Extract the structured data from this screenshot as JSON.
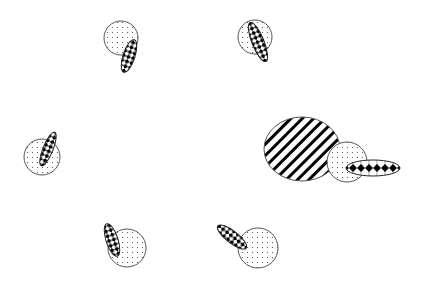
{
  "diagram": {
    "width": 421,
    "height": 294,
    "background": "#ffffff",
    "stroke_color": "#555555",
    "fill_color": "#000000",
    "groups": [
      {
        "name": "top-left-pair",
        "circle": {
          "cx": 121,
          "cy": 38,
          "r": 17,
          "pattern": "dots"
        },
        "ellipse": {
          "cx": 129,
          "cy": 56,
          "rx": 6,
          "ry": 17,
          "rotate": 18,
          "pattern": "checker"
        }
      },
      {
        "name": "top-right-pair",
        "circle": {
          "cx": 255,
          "cy": 37,
          "r": 17,
          "pattern": "dots"
        },
        "ellipse": {
          "cx": 258,
          "cy": 42,
          "rx": 6,
          "ry": 21,
          "rotate": -22,
          "pattern": "checker"
        }
      },
      {
        "name": "left-pair",
        "circle": {
          "cx": 42,
          "cy": 157,
          "r": 18,
          "pattern": "dots"
        },
        "ellipse": {
          "cx": 48,
          "cy": 149,
          "rx": 5,
          "ry": 18,
          "rotate": 22,
          "pattern": "checker"
        }
      },
      {
        "name": "right-cluster",
        "big_ellipse": {
          "cx": 302,
          "cy": 149,
          "rx": 38,
          "ry": 32,
          "pattern": "hatch"
        },
        "circle": {
          "cx": 347,
          "cy": 162,
          "r": 20,
          "pattern": "dots"
        },
        "ellipse": {
          "cx": 373,
          "cy": 168,
          "rx": 27,
          "ry": 8,
          "rotate": 0,
          "pattern": "diamonds-row"
        }
      },
      {
        "name": "bottom-left-pair",
        "circle": {
          "cx": 127,
          "cy": 248,
          "r": 19,
          "pattern": "dots"
        },
        "ellipse": {
          "cx": 112,
          "cy": 240,
          "rx": 6,
          "ry": 17,
          "rotate": -18,
          "pattern": "checker"
        }
      },
      {
        "name": "bottom-right-pair",
        "circle": {
          "cx": 258,
          "cy": 248,
          "r": 20,
          "pattern": "dots"
        },
        "ellipse": {
          "cx": 232,
          "cy": 237,
          "rx": 6,
          "ry": 18,
          "rotate": -52,
          "pattern": "checker"
        }
      }
    ]
  }
}
